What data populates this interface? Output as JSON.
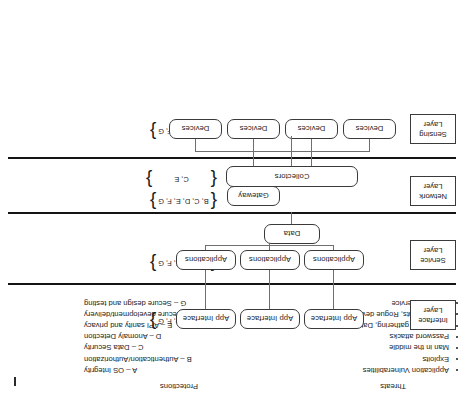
{
  "legends": {
    "threats": {
      "title": "Threats",
      "items": [
        "Application Vulnerabilities",
        "Exploits",
        "Man in the middle",
        "Password attacks",
        "Information gathering, Data leakage",
        "Rogue clients, Rogue devices",
        "Denial of Service"
      ]
    },
    "protections": {
      "title": "Protections",
      "items": [
        "A – OS Integrity",
        "B – Authentication/Authorization",
        "C – Data Security",
        "D – Anomaly Detection",
        "E – API sanity and privacy",
        "F – Secure development/delivery",
        "G – Secure design and testing"
      ]
    }
  },
  "layers": [
    {
      "id": "interface",
      "label_line1": "Interface",
      "label_line2": "Layer",
      "set": "A, B, C, D, F, G",
      "nodes": [
        "App Interface",
        "App Interface",
        "App Interface"
      ]
    },
    {
      "id": "service",
      "label_line1": "Service",
      "label_line2": "Layer",
      "set": "B, C, D, E, F, G",
      "nodes": [
        "Applications",
        "Applications",
        "Applications"
      ],
      "extra_nodes": [
        "Data"
      ]
    },
    {
      "id": "network",
      "label_line1": "Network",
      "label_line2": "Layer",
      "set": "C, E",
      "set_secondary": "B, C, D, E, F, G",
      "nodes": [
        "Collectors"
      ],
      "extra_nodes": [
        "Gateway"
      ]
    },
    {
      "id": "sensing",
      "label_line1": "Sensing",
      "label_line2": "Layer",
      "set": "A, B, C, D, F, G",
      "nodes": [
        "Devices",
        "Devices",
        "Devices",
        "Devices"
      ]
    }
  ],
  "braces": {
    "open": "{",
    "close": "}"
  }
}
